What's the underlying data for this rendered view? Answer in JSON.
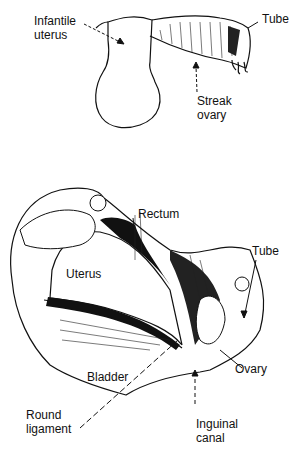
{
  "figure": {
    "top_panel": {
      "title": "Streak gonad / infantile uterus",
      "labels": {
        "infantile_uterus": "Infantile\nuterus",
        "tube": "Tube",
        "streak_ovary": "Streak\novary"
      }
    },
    "bottom_panel": {
      "labels": {
        "rectum": "Rectum",
        "uterus": "Uterus",
        "tube": "Tube",
        "ovary": "Ovary",
        "bladder": "Bladder",
        "round_ligament": "Round\nligament",
        "inguinal_canal": "Inguinal\ncanal"
      }
    }
  },
  "colors": {
    "ink": "#111111",
    "paper": "#ffffff",
    "shade": "#2a2a2a"
  }
}
